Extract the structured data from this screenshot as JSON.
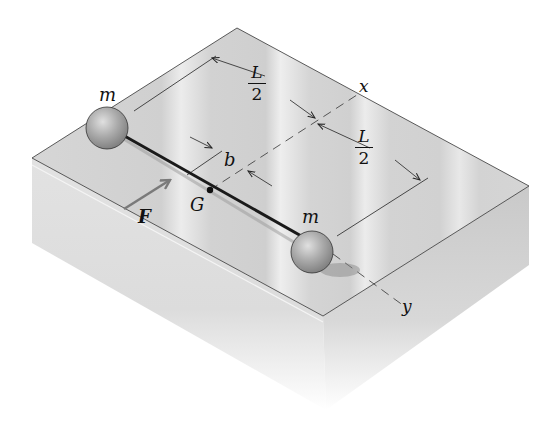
{
  "figure": {
    "labels": {
      "mass_left": "m",
      "mass_right": "m",
      "half_length_top": {
        "numerator": "L",
        "denominator": "2"
      },
      "half_length_bottom": {
        "numerator": "L",
        "denominator": "2"
      },
      "offset": "b",
      "center_of_mass": "G",
      "force": "F",
      "axis_x": "x",
      "axis_y": "y"
    },
    "colors": {
      "block_top": "#d9d9d9",
      "block_left": "#e4e4e4",
      "block_right": "#cfcfcf",
      "rod": "#1a1a1a",
      "mass": "#a8a8a8",
      "force_arrow": "#7a7a7a",
      "line": "#222222"
    }
  }
}
